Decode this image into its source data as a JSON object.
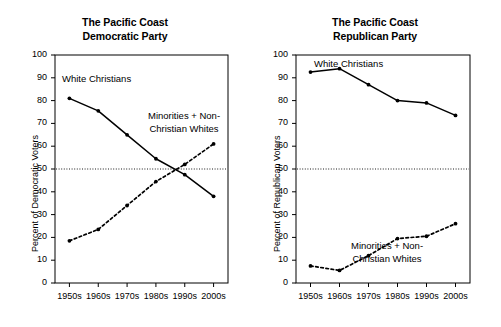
{
  "figure": {
    "background": "#ffffff",
    "ink_color": "#000000"
  },
  "panels": [
    {
      "id": "democratic",
      "title_line1": "The Pacific Coast",
      "title_line2": "Democratic Party",
      "ylabel": "Percent of Democratic Voters",
      "annotations": [
        {
          "name": "white-christians",
          "line1": "White Christians",
          "line2": ""
        },
        {
          "name": "minorities-non-christian-whites",
          "line1": "Minorities + Non-",
          "line2": "Christian Whites"
        }
      ],
      "ref_line_value": 50
    },
    {
      "id": "republican",
      "title_line1": "The Pacific Coast",
      "title_line2": "Republican Party",
      "ylabel": "Percent of Republican Voters",
      "annotations": [
        {
          "name": "white-christians",
          "line1": "White Christians",
          "line2": ""
        },
        {
          "name": "minorities-non-christian-whites",
          "line1": "Minorities + Non-",
          "line2": "Christian Whites"
        }
      ],
      "ref_line_value": 50
    }
  ],
  "axis": {
    "ytick_labels": [
      "100",
      "90",
      "80",
      "70",
      "60",
      "50",
      "40",
      "30",
      "20",
      "10",
      "0"
    ],
    "ytick_values": [
      100,
      90,
      80,
      70,
      60,
      50,
      40,
      30,
      20,
      10,
      0
    ],
    "xtick_labels": [
      "1950s",
      "1960s",
      "1970s",
      "1980s",
      "1990s",
      "2000s"
    ]
  },
  "chart_data": [
    {
      "type": "line",
      "title": "The Pacific Coast Democratic Party",
      "xlabel": "",
      "ylabel": "Percent of Democratic Voters",
      "categories": [
        "1950s",
        "1960s",
        "1970s",
        "1980s",
        "1990s",
        "2000s"
      ],
      "ylim": [
        0,
        100
      ],
      "ytick_step": 10,
      "grid": false,
      "legend_position": "inline-annotations",
      "reference_lines": [
        {
          "value": 50,
          "style": "dotted",
          "orientation": "horizontal"
        }
      ],
      "series": [
        {
          "name": "White Christians",
          "style": "solid",
          "marker": "filled-circle",
          "values": [
            81,
            75.5,
            65,
            54.5,
            47.5,
            38
          ]
        },
        {
          "name": "Minorities + Non-Christian Whites",
          "style": "dashed",
          "marker": "filled-circle",
          "values": [
            18.5,
            23.5,
            34,
            44.5,
            52,
            61
          ]
        }
      ]
    },
    {
      "type": "line",
      "title": "The Pacific Coast Republican Party",
      "xlabel": "",
      "ylabel": "Percent of Republican Voters",
      "categories": [
        "1950s",
        "1960s",
        "1970s",
        "1980s",
        "1990s",
        "2000s"
      ],
      "ylim": [
        0,
        100
      ],
      "ytick_step": 10,
      "grid": false,
      "legend_position": "inline-annotations",
      "reference_lines": [
        {
          "value": 50,
          "style": "dotted",
          "orientation": "horizontal"
        }
      ],
      "series": [
        {
          "name": "White Christians",
          "style": "solid",
          "marker": "filled-circle",
          "values": [
            92.5,
            94,
            87,
            80,
            79,
            73.5
          ]
        },
        {
          "name": "Minorities + Non-Christian Whites",
          "style": "dashed",
          "marker": "filled-circle",
          "values": [
            7.5,
            5.5,
            12,
            19.5,
            20.5,
            26
          ]
        }
      ]
    }
  ]
}
